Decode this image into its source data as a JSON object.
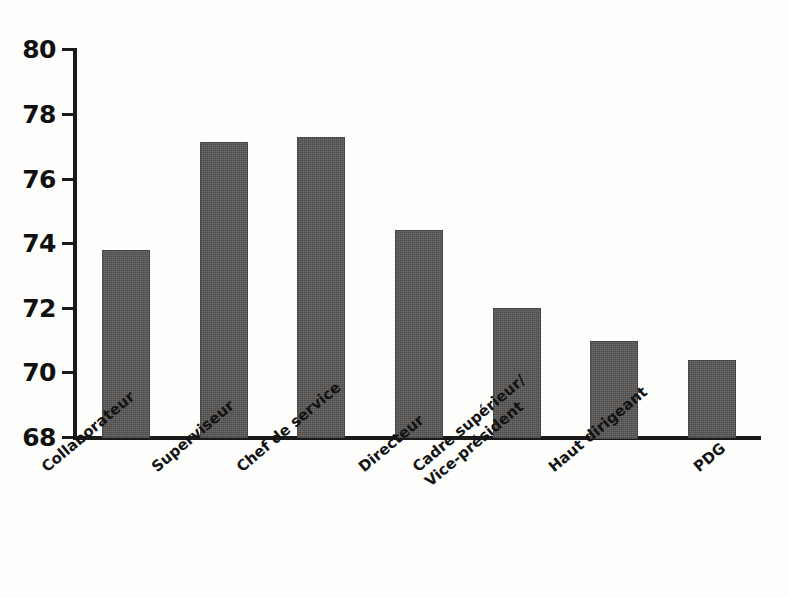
{
  "chart_data": {
    "type": "bar",
    "title": "",
    "subtitle": "",
    "xlabel": "",
    "ylabel": "",
    "categories": [
      "Collaborateur",
      "Superviseur",
      "Chef de service",
      "Directeur",
      "Cadre supérieur/\nVice-président",
      "Haut dirigeant",
      "PDG"
    ],
    "values": [
      73.8,
      77.1,
      77.25,
      74.4,
      72.0,
      71.0,
      70.4
    ],
    "series": [
      {
        "name": "",
        "values": [
          73.8,
          77.1,
          77.25,
          74.4,
          72.0,
          71.0,
          70.4
        ]
      }
    ],
    "ylim": [
      68,
      80
    ],
    "yticks": [
      80,
      78,
      76,
      74,
      72,
      70,
      68
    ],
    "ytick_labels": [
      "80",
      "78",
      "76",
      "74",
      "72",
      "70",
      "68"
    ],
    "xticks": [],
    "grid": false,
    "legend": false,
    "legend_position": "none",
    "bar_color": "#555452",
    "axis_color": "#1a1a1a",
    "background_color": "#fdfdfc",
    "annotations": []
  }
}
